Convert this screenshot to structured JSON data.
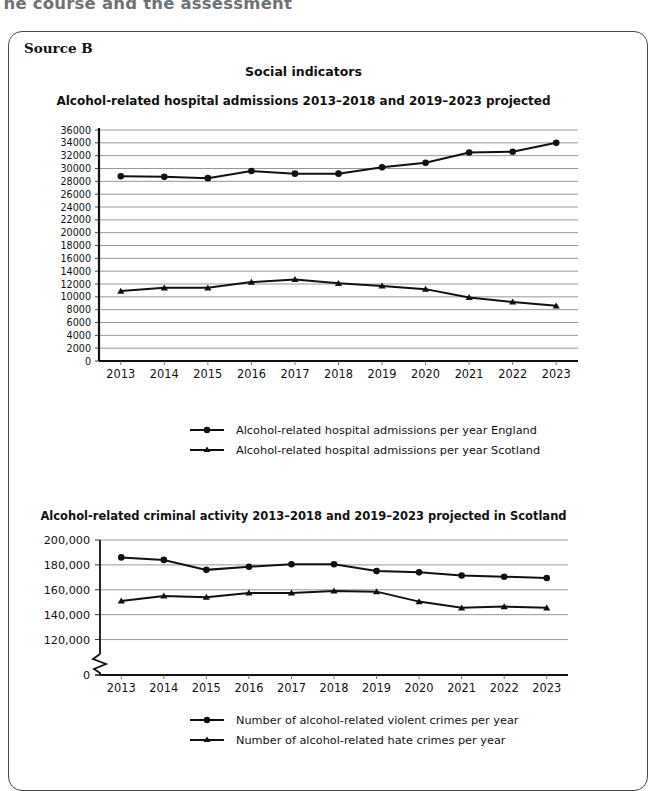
{
  "page": {
    "running_header": "The course and the assessment",
    "source_label": "Source B",
    "main_title": "Social indicators"
  },
  "legend_marker_circle": "circle-marker-icon",
  "legend_marker_triangle": "triangle-marker-icon",
  "chart_data": [
    {
      "id": "chart1",
      "type": "line",
      "title": "Alcohol-related hospital admissions 2013–2018 and 2019–2023 projected",
      "xlabel": "",
      "ylabel": "",
      "x": [
        "2013",
        "2014",
        "2015",
        "2016",
        "2017",
        "2018",
        "2019",
        "2020",
        "2021",
        "2022",
        "2023"
      ],
      "ylim": [
        0,
        36000
      ],
      "ytick_step": 2000,
      "yticks": [
        "0",
        "2000",
        "4000",
        "6000",
        "8000",
        "10000",
        "12000",
        "14000",
        "16000",
        "18000",
        "20000",
        "22000",
        "24000",
        "26000",
        "28000",
        "30000",
        "32000",
        "34000",
        "36000"
      ],
      "grid": true,
      "legend_position": "bottom",
      "series": [
        {
          "name": "Alcohol-related hospital admissions per year England",
          "marker": "circle",
          "values": [
            28800,
            28700,
            28500,
            29600,
            29200,
            29200,
            30200,
            30900,
            32500,
            32600,
            34000
          ]
        },
        {
          "name": "Alcohol-related hospital admissions per year Scotland",
          "marker": "triangle",
          "values": [
            10900,
            11400,
            11400,
            12300,
            12700,
            12100,
            11700,
            11200,
            9900,
            9200,
            8600
          ]
        }
      ]
    },
    {
      "id": "chart2",
      "type": "line",
      "title": "Alcohol-related criminal activity 2013–2018 and 2019–2023 projected in Scotland",
      "xlabel": "",
      "ylabel": "",
      "x": [
        "2013",
        "2014",
        "2015",
        "2016",
        "2017",
        "2018",
        "2019",
        "2020",
        "2021",
        "2022",
        "2023"
      ],
      "ylim": [
        110000,
        200000
      ],
      "broken_axis": true,
      "yticks": [
        "0",
        "120,000",
        "140,000",
        "160,000",
        "180,000",
        "200,000"
      ],
      "grid": true,
      "legend_position": "bottom",
      "series": [
        {
          "name": "Number of alcohol-related violent crimes per year",
          "marker": "circle",
          "values": [
            186000,
            184000,
            176000,
            178500,
            180500,
            180500,
            175000,
            174000,
            171500,
            170500,
            169500
          ]
        },
        {
          "name": "Number of alcohol-related hate crimes per year",
          "marker": "triangle",
          "values": [
            151000,
            155000,
            154000,
            157500,
            157500,
            159000,
            158500,
            150500,
            145500,
            146500,
            145500
          ]
        }
      ]
    }
  ]
}
